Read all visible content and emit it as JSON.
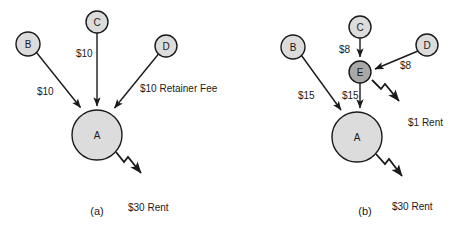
{
  "figure": {
    "background": "#ffffff",
    "stroke_color": "#1a1a1a",
    "node_fill_light": "#dcdcdc",
    "node_fill_mid": "#a8a8a8"
  },
  "panels": [
    {
      "id": "a",
      "caption": "(a)",
      "nodes": [
        {
          "id": "a-B",
          "label": "B",
          "cx": 28,
          "cy": 44,
          "r": 12,
          "shade": "light"
        },
        {
          "id": "a-C",
          "label": "C",
          "cx": 97,
          "cy": 22,
          "r": 11,
          "shade": "light"
        },
        {
          "id": "a-D",
          "label": "D",
          "cx": 166,
          "cy": 46,
          "r": 11,
          "shade": "light"
        },
        {
          "id": "a-A",
          "label": "A",
          "cx": 97,
          "cy": 135,
          "r": 25,
          "shade": "light"
        }
      ],
      "edges": [
        {
          "id": "a-B-to-A",
          "from": "B",
          "to": "A",
          "label": "$10",
          "label_x": 37,
          "label_y": 95
        },
        {
          "id": "a-C-to-A",
          "from": "C",
          "to": "A",
          "label": "$10",
          "label_x": 76,
          "label_y": 57
        },
        {
          "id": "a-D-to-A",
          "from": "D",
          "to": "A",
          "label": "$10 Retainer Fee",
          "label_x": 140,
          "label_y": 92
        }
      ],
      "outflows": [
        {
          "id": "a-A-rent",
          "from": "A",
          "label": "$30 Rent",
          "label_x": 128,
          "label_y": 211
        }
      ]
    },
    {
      "id": "b",
      "caption": "(b)",
      "nodes": [
        {
          "id": "b-B",
          "label": "B",
          "cx": 293,
          "cy": 47,
          "r": 12,
          "shade": "light"
        },
        {
          "id": "b-C",
          "label": "C",
          "cx": 360,
          "cy": 27,
          "r": 11,
          "shade": "light"
        },
        {
          "id": "b-D",
          "label": "D",
          "cx": 427,
          "cy": 45,
          "r": 11,
          "shade": "light"
        },
        {
          "id": "b-E",
          "label": "E",
          "cx": 360,
          "cy": 72,
          "r": 11,
          "shade": "mid"
        },
        {
          "id": "b-A",
          "label": "A",
          "cx": 357,
          "cy": 137,
          "r": 25,
          "shade": "light"
        }
      ],
      "edges": [
        {
          "id": "b-C-to-E",
          "from": "C",
          "to": "E",
          "label": "$8",
          "label_x": 339,
          "label_y": 53
        },
        {
          "id": "b-D-to-E",
          "from": "D",
          "to": "E",
          "label": "$8",
          "label_x": 400,
          "label_y": 69
        },
        {
          "id": "b-B-to-A",
          "from": "B",
          "to": "A",
          "label": "$15",
          "label_x": 298,
          "label_y": 99
        },
        {
          "id": "b-E-to-A",
          "from": "E",
          "to": "A",
          "label": "$15",
          "label_x": 342,
          "label_y": 99
        }
      ],
      "outflows": [
        {
          "id": "b-E-rent",
          "from": "E",
          "label": "$1 Rent",
          "label_x": 408,
          "label_y": 126
        },
        {
          "id": "b-A-rent",
          "from": "A",
          "label": "$30 Rent",
          "label_x": 392,
          "label_y": 210
        }
      ]
    }
  ],
  "captions": {
    "panel_a": "(a)",
    "panel_b": "(b)"
  }
}
